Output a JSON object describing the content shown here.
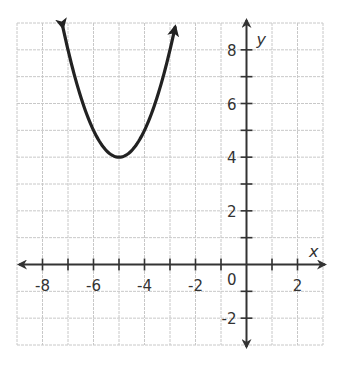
{
  "chart_data": {
    "type": "line",
    "title": "",
    "xlabel": "x",
    "ylabel": "y",
    "xlim": [
      -9,
      3
    ],
    "ylim": [
      -3,
      9
    ],
    "grid": true,
    "x_ticks": [
      -8,
      -6,
      -4,
      -2,
      0,
      2
    ],
    "y_ticks": [
      -2,
      2,
      4,
      6,
      8
    ],
    "x_tick_labels": [
      "-8",
      "-6",
      "-4",
      "-2",
      "2"
    ],
    "y_tick_labels": [
      "-2",
      "2",
      "4",
      "6",
      "8"
    ],
    "origin_label": "0",
    "series": [
      {
        "name": "parabola",
        "equation": "y = (x + 5)^2 + 4",
        "vertex": [
          -5,
          4
        ],
        "x": [
          -7.2,
          -7,
          -6.5,
          -6,
          -5.5,
          -5,
          -4.5,
          -4,
          -3.5,
          -3,
          -2.8
        ],
        "values": [
          8.84,
          8,
          6.25,
          5,
          4.25,
          4,
          4.25,
          5,
          6.25,
          8,
          8.84
        ],
        "arrows_at_ends": true,
        "color": "#222222"
      }
    ],
    "legend": null
  },
  "colors": {
    "grid": "#c8c8c8",
    "axis": "#333333",
    "curve": "#222222",
    "background": "#ffffff"
  }
}
